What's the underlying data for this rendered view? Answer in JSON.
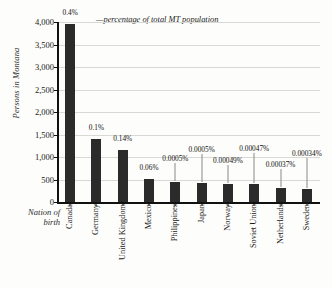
{
  "chart_data": {
    "type": "bar",
    "title": "",
    "xlabel": "Nation of birth",
    "ylabel": "Persons in Montana",
    "ylim": [
      0,
      4000
    ],
    "ytick_values": [
      0,
      500,
      1000,
      1500,
      2000,
      2500,
      3000,
      3500,
      4000
    ],
    "ytick_labels": [
      "0",
      "500",
      "1,000",
      "1,500",
      "2,000",
      "2,500",
      "3,000",
      "3,500",
      "4,000"
    ],
    "grid": true,
    "legend_position": "top",
    "legend": [
      "—percentage of total MT population"
    ],
    "categories": [
      "Canada",
      "Germany",
      "United Kingdom",
      "Mexico",
      "Philippines",
      "Japan",
      "Norway",
      "Soviet Union",
      "Netherlands",
      "Sweden"
    ],
    "values": [
      3960,
      1390,
      1150,
      520,
      440,
      420,
      410,
      390,
      320,
      290
    ],
    "data_labels": [
      "0.4%",
      "0.1%",
      "0.14%",
      "0.06%",
      "0.0005%",
      "0.0005%",
      "0.00049%",
      "0.00047%",
      "0.00037%",
      "0.00034%"
    ],
    "series": [
      {
        "name": "Persons in Montana",
        "values": [
          3960,
          1390,
          1150,
          520,
          440,
          420,
          410,
          390,
          320,
          290
        ],
        "color": "#2b2b2b"
      }
    ]
  },
  "axis": {
    "y_title": "Persons in Montana",
    "x_title_line1": "Nation of",
    "x_title_line2": "birth"
  },
  "legend": {
    "text": "—percentage of total MT population"
  },
  "colors": {
    "bar": "#2b2b2b",
    "grid": "#d8d8d4",
    "axis": "#111111",
    "background": "#fdfdfb"
  }
}
